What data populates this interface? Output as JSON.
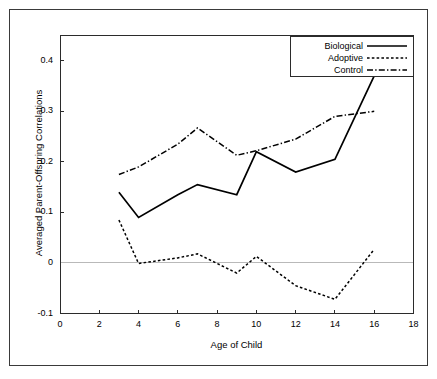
{
  "figure": {
    "background_color": "#ffffff",
    "frame_color": "#3a3a3a",
    "line_color": "#000000",
    "zero_line_color": "#b9b9b9"
  },
  "legend": {
    "position": "top-right",
    "entries": [
      {
        "label": "Biological",
        "style": "solid",
        "icon": "legend-line-solid-icon"
      },
      {
        "label": "Adoptive",
        "style": "dotted",
        "icon": "legend-line-dotted-icon"
      },
      {
        "label": "Control",
        "style": "dash-dot",
        "icon": "legend-line-dashdot-icon"
      }
    ]
  },
  "chart_data": {
    "type": "line",
    "title": "",
    "xlabel": "Age of Child",
    "ylabel": "Averaged Parent-Offspring Correlations",
    "xlim": [
      0,
      18
    ],
    "ylim": [
      -0.1,
      0.45
    ],
    "xticks": [
      0,
      2,
      4,
      6,
      8,
      10,
      12,
      14,
      16,
      18
    ],
    "xticklabels": [
      "0",
      "2",
      "4",
      "6",
      "8",
      "10",
      "12",
      "14",
      "16",
      "18"
    ],
    "yticks": [
      -0.1,
      0,
      0.1,
      0.2,
      0.3,
      0.4
    ],
    "yticklabels": [
      "-0.1",
      "0",
      "0.1",
      "0.2",
      "0.3",
      "0.4"
    ],
    "grid": false,
    "zero_reference_line": true,
    "legend_position": "upper right",
    "x": [
      3,
      4,
      6,
      7,
      9,
      10,
      12,
      14,
      16
    ],
    "series": [
      {
        "name": "Biological",
        "style": "solid",
        "values": [
          0.14,
          0.09,
          0.135,
          0.155,
          0.135,
          0.22,
          0.18,
          0.205,
          0.37
        ]
      },
      {
        "name": "Adoptive",
        "style": "dotted",
        "values": [
          0.085,
          -0.001,
          0.01,
          0.018,
          -0.02,
          0.013,
          -0.045,
          -0.072,
          0.027
        ]
      },
      {
        "name": "Control",
        "style": "dash-dot",
        "values": [
          0.175,
          0.19,
          0.235,
          0.267,
          0.213,
          0.222,
          0.245,
          0.29,
          0.3
        ]
      }
    ]
  }
}
